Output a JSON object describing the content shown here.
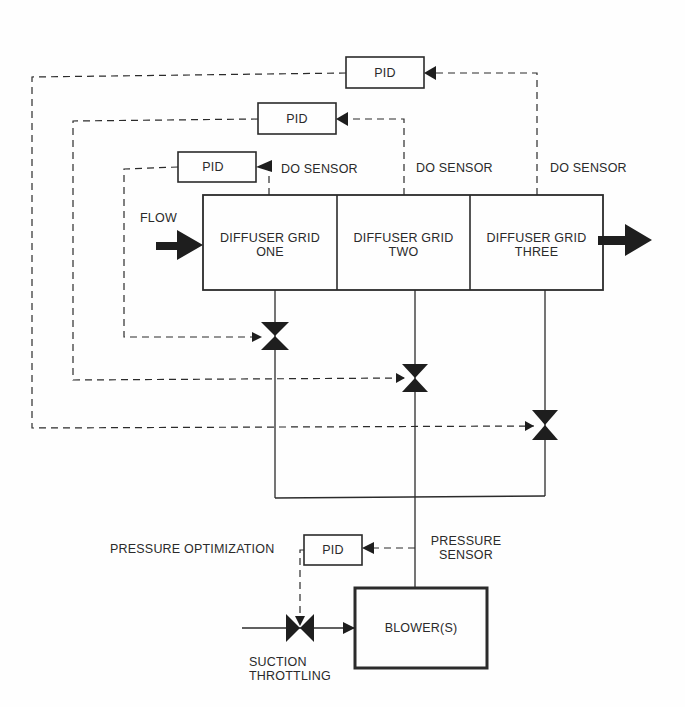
{
  "diagram": {
    "type": "control-schematic",
    "colors": {
      "line": "#2b2b2b",
      "background": "#fefefe"
    },
    "pid_controllers": [
      {
        "id": "pid-grid-3",
        "label": "PID"
      },
      {
        "id": "pid-grid-2",
        "label": "PID"
      },
      {
        "id": "pid-grid-1",
        "label": "PID"
      },
      {
        "id": "pid-pressure",
        "label": "PID"
      }
    ],
    "sensors": [
      {
        "label": "DO SENSOR"
      },
      {
        "label": "DO SENSOR"
      },
      {
        "label": "DO SENSOR"
      }
    ],
    "flow_label": "FLOW",
    "grids": [
      {
        "line1": "DIFFUSER GRID",
        "line2": "ONE"
      },
      {
        "line1": "DIFFUSER GRID",
        "line2": "TWO"
      },
      {
        "line1": "DIFFUSER GRID",
        "line2": "THREE"
      }
    ],
    "pressure_optimization": "PRESSURE OPTIMIZATION",
    "pressure_sensor": {
      "line1": "PRESSURE",
      "line2": "SENSOR"
    },
    "blower": "BLOWER(S)",
    "suction_throttling": {
      "line1": "SUCTION",
      "line2": "THROTTLING"
    }
  }
}
